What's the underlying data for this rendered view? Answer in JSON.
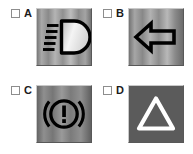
{
  "question": {
    "type": "multiple-choice-image-grid",
    "columns": 2,
    "rows": 2
  },
  "colors": {
    "page_background": "#ffffff",
    "checkbox_border": "#8d8d8d",
    "letter_color": "#1b1b1b",
    "tile_light": "#d7d7d7",
    "tile_mid": "#8f8f8f",
    "tile_dark": "#4e4e4e",
    "symbol_black": "#000000",
    "symbol_white": "#ffffff",
    "tile_d_flat": "#5b5b5b"
  },
  "options": [
    {
      "letter": "A",
      "checked": false,
      "checkbox_name": "checkbox-a",
      "icon_name": "low-beam-headlight-icon",
      "icon_description": "Low beam headlight symbol: D-shaped lamp with five angled light rays",
      "tile_style": "vertical-brushed-gradient",
      "symbol_color": "#000000"
    },
    {
      "letter": "B",
      "checked": false,
      "checkbox_name": "checkbox-b",
      "icon_name": "left-turn-arrow-icon",
      "icon_description": "Left pointing turn signal arrow outline",
      "tile_style": "vertical-brushed-gradient",
      "symbol_color": "#000000"
    },
    {
      "letter": "C",
      "checked": false,
      "checkbox_name": "checkbox-c",
      "icon_name": "brake-warning-icon",
      "icon_description": "Brake system warning: exclamation mark inside circle with brake disc arcs",
      "tile_style": "vertical-brushed-gradient",
      "symbol_color": "#000000"
    },
    {
      "letter": "D",
      "checked": false,
      "checkbox_name": "checkbox-d",
      "icon_name": "hazard-warning-triangle-icon",
      "icon_description": "Hazard warning triangle outline",
      "tile_style": "flat-gray",
      "symbol_color": "#ffffff"
    }
  ]
}
